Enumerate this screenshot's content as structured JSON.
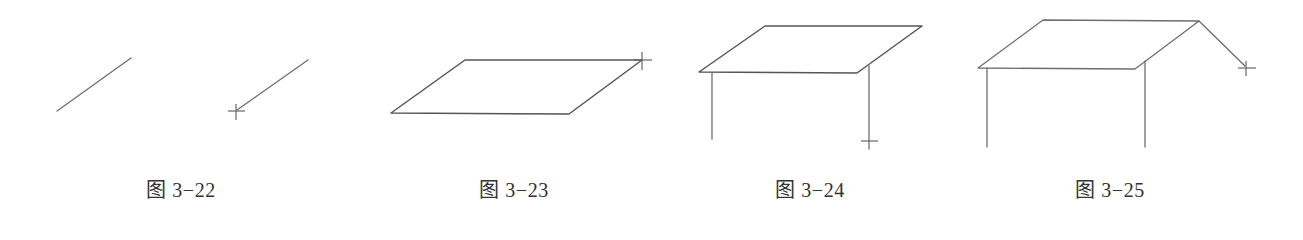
{
  "figures": [
    {
      "id": "fig-3-22",
      "caption": "图 3−22",
      "description": "Two parallel diagonal line segments; second one ends at cursor crosshair",
      "lines": [
        {
          "x1": 57,
          "y1": 111,
          "x2": 131,
          "y2": 58
        },
        {
          "x1": 237,
          "y1": 110,
          "x2": 308,
          "y2": 60
        }
      ],
      "cursor": {
        "x": 236,
        "y": 112,
        "icon": "crosshair-icon"
      }
    },
    {
      "id": "fig-3-23",
      "caption": "图 3−23",
      "description": "Parallelogram (roof plane) closed with cursor at top-right vertex",
      "polygon": [
        [
          465,
          60
        ],
        [
          642,
          60
        ],
        [
          569,
          114
        ],
        [
          391,
          113
        ]
      ],
      "cursor": {
        "x": 642,
        "y": 60,
        "icon": "crosshair-icon"
      }
    },
    {
      "id": "fig-3-24",
      "caption": "图 3−24",
      "description": "Parallelogram with two vertical legs drawn downward; cursor at bottom of right leg",
      "polygon": [
        [
          765,
          26
        ],
        [
          922,
          26
        ],
        [
          857,
          73
        ],
        [
          699,
          72
        ]
      ],
      "lines": [
        {
          "x1": 712,
          "y1": 73,
          "x2": 712,
          "y2": 139
        },
        {
          "x1": 869,
          "y1": 66,
          "x2": 869,
          "y2": 145
        }
      ],
      "cursor": {
        "x": 869,
        "y": 142,
        "icon": "crosshair-icon"
      }
    },
    {
      "id": "fig-3-25",
      "caption": "图 3−25",
      "description": "Parallelogram with two vertical legs and a diagonal line from top-right vertex to cursor",
      "polygon": [
        [
          1043,
          20
        ],
        [
          1199,
          21
        ],
        [
          1135,
          69
        ],
        [
          978,
          68
        ]
      ],
      "lines": [
        {
          "x1": 987,
          "y1": 68,
          "x2": 987,
          "y2": 147
        },
        {
          "x1": 1145,
          "y1": 61,
          "x2": 1145,
          "y2": 147
        },
        {
          "x1": 1199,
          "y1": 21,
          "x2": 1245,
          "y2": 66
        }
      ],
      "cursor": {
        "x": 1246,
        "y": 68,
        "icon": "crosshair-icon"
      }
    }
  ],
  "colors": {
    "line": "#6e6e6e",
    "caption": "#333333",
    "background": "#ffffff"
  }
}
